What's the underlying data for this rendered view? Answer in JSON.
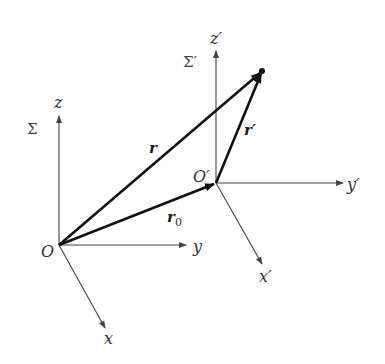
{
  "diagram": {
    "title": "",
    "frames": [
      {
        "name": "Sigma",
        "label": "Σ",
        "origin_label": "O",
        "axes": {
          "x": "x",
          "y": "y",
          "z": "z"
        }
      },
      {
        "name": "Sigma-prime",
        "label": "Σ′",
        "origin_label": "O′",
        "axes": {
          "x": "x′",
          "y": "y′",
          "z": "z′"
        }
      }
    ],
    "vectors": {
      "r": {
        "label": "r",
        "from": "O",
        "to": "P"
      },
      "r0": {
        "label": "r",
        "subscript": "0",
        "from": "O",
        "to": "O′"
      },
      "r_prime": {
        "label": "r′",
        "from": "O′",
        "to": "P"
      }
    },
    "colors": {
      "axis": "#444444",
      "vector": "#111111",
      "background": "#ffffff"
    }
  }
}
